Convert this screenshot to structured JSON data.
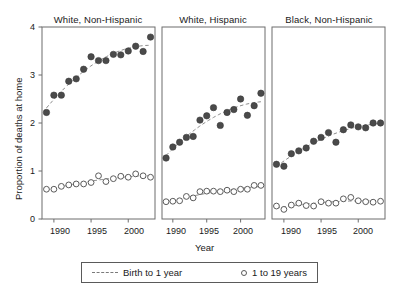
{
  "figure": {
    "ylabel": "Proportion of deaths at home",
    "xlabel": "Year",
    "ytick_labels": [
      "0",
      "1",
      "2",
      "3",
      "4"
    ],
    "xtick_labels": [
      "1990",
      "1995",
      "2000"
    ],
    "legend": {
      "items": [
        {
          "label": "Birth to 1 year",
          "marker": "dashed-line"
        },
        {
          "label": "1 to 19 years",
          "marker": "open-circle"
        }
      ]
    }
  },
  "chart_data": {
    "type": "scatter",
    "title": "",
    "xlabel": "Year",
    "ylabel": "Proportion of deaths at home",
    "xlim": [
      1988.4,
      2003.6
    ],
    "ylim": [
      0,
      4
    ],
    "xticks": [
      1990,
      1995,
      2000
    ],
    "yticks": [
      0,
      1,
      2,
      3,
      4
    ],
    "grid": false,
    "legend_position": "bottom",
    "panels": [
      {
        "title": "White, Non-Hispanic",
        "x": [
          1989,
          1990,
          1991,
          1992,
          1993,
          1994,
          1995,
          1996,
          1997,
          1998,
          1999,
          2000,
          2001,
          2002,
          2003
        ],
        "series": [
          {
            "name": "Birth to 1 year",
            "marker": "filled-circle",
            "fit": "dashed-trend",
            "values": [
              2.22,
              2.58,
              2.58,
              2.87,
              2.92,
              3.12,
              3.38,
              3.3,
              3.3,
              3.43,
              3.42,
              3.5,
              3.6,
              3.49,
              3.79
            ]
          },
          {
            "name": "1 to 19 years",
            "marker": "open-circle",
            "fit": "dashed-trend",
            "values": [
              0.62,
              0.62,
              0.68,
              0.71,
              0.73,
              0.73,
              0.76,
              0.9,
              0.78,
              0.84,
              0.89,
              0.87,
              0.94,
              0.9,
              0.87
            ]
          }
        ]
      },
      {
        "title": "White, Hispanic",
        "x": [
          1989,
          1990,
          1991,
          1992,
          1993,
          1994,
          1995,
          1996,
          1997,
          1998,
          1999,
          2000,
          2001,
          2002,
          2003
        ],
        "series": [
          {
            "name": "Birth to 1 year",
            "marker": "filled-circle",
            "fit": "dashed-trend",
            "values": [
              1.27,
              1.5,
              1.6,
              1.7,
              1.72,
              2.06,
              2.15,
              2.32,
              1.95,
              2.22,
              2.28,
              2.5,
              2.16,
              2.36,
              2.62
            ]
          },
          {
            "name": "1 to 19 years",
            "marker": "open-circle",
            "fit": "dashed-trend",
            "values": [
              0.36,
              0.37,
              0.38,
              0.47,
              0.44,
              0.57,
              0.58,
              0.58,
              0.57,
              0.6,
              0.57,
              0.62,
              0.62,
              0.7,
              0.7
            ]
          }
        ]
      },
      {
        "title": "Black, Non-Hispanic",
        "x": [
          1989,
          1990,
          1991,
          1992,
          1993,
          1994,
          1995,
          1996,
          1997,
          1998,
          1999,
          2000,
          2001,
          2002,
          2003
        ],
        "series": [
          {
            "name": "Birth to 1 year",
            "marker": "filled-circle",
            "fit": "dashed-trend",
            "values": [
              1.14,
              1.1,
              1.36,
              1.42,
              1.48,
              1.62,
              1.7,
              1.8,
              1.6,
              1.86,
              1.96,
              1.92,
              1.9,
              2.0,
              2.0
            ]
          },
          {
            "name": "1 to 19 years",
            "marker": "open-circle",
            "fit": "dashed-trend",
            "values": [
              0.27,
              0.2,
              0.29,
              0.33,
              0.28,
              0.27,
              0.36,
              0.33,
              0.33,
              0.42,
              0.45,
              0.38,
              0.36,
              0.35,
              0.37
            ]
          }
        ]
      }
    ]
  }
}
